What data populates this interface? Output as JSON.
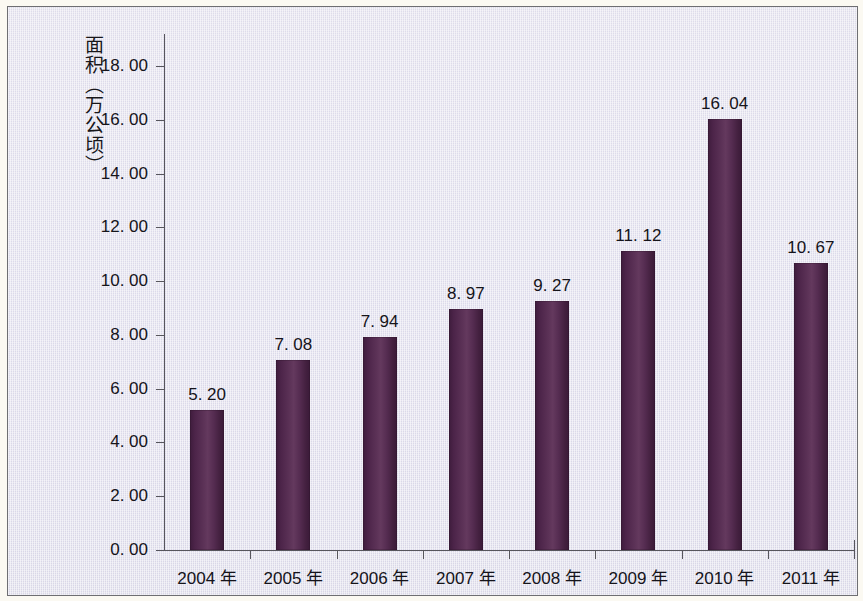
{
  "chart_data": {
    "type": "bar",
    "title": "",
    "subtitle": "",
    "xlabel": "",
    "ylabel": "面积（万公顷）",
    "categories": [
      "2004 年",
      "2005 年",
      "2006 年",
      "2007 年",
      "2008 年",
      "2009 年",
      "2010 年",
      "2011 年"
    ],
    "values": [
      5.2,
      7.08,
      7.94,
      8.97,
      9.27,
      11.12,
      16.04,
      10.67
    ],
    "value_labels": [
      "5. 20",
      "7. 08",
      "7. 94",
      "8. 97",
      "9. 27",
      "11. 12",
      "16. 04",
      "10. 67"
    ],
    "ylim": [
      0,
      18
    ],
    "ytick_values": [
      0,
      2,
      4,
      6,
      8,
      10,
      12,
      14,
      16,
      18
    ],
    "ytick_labels": [
      "0. 00",
      "2. 00",
      "4. 00",
      "6. 00",
      "8. 00",
      "10. 00",
      "12. 00",
      "14. 00",
      "16. 00",
      "18. 00"
    ],
    "grid": false,
    "legend": false,
    "legend_position": "none",
    "series": [
      {
        "name": "面积",
        "values": [
          5.2,
          7.08,
          7.94,
          8.97,
          9.27,
          11.12,
          16.04,
          10.67
        ]
      }
    ],
    "colors": {
      "bar": "#4c2449",
      "bar_highlight": "#64395e",
      "bar_shadow": "#3a1a38",
      "plot_background": "#dcdaea",
      "axis": "#56555c",
      "text": "#15141a",
      "page_margin": "#fbf9f2",
      "frame_border": "#6e6e72"
    }
  }
}
